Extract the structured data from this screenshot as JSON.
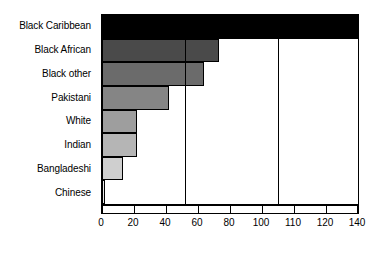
{
  "chart_data": {
    "type": "bar",
    "orientation": "horizontal",
    "title": "",
    "subtitle": "",
    "xlabel": "",
    "ylabel": "",
    "grid": false,
    "legend": null,
    "legend_position": "none",
    "axis_note": "x tick labels are equally spaced on screen although their numeric gaps differ (0,20,40,60,80,100,110,120,140)",
    "xticks": [
      0,
      20,
      40,
      60,
      80,
      100,
      110,
      120,
      140
    ],
    "xtick_labels": [
      "0",
      "20",
      "40",
      "60",
      "80",
      "100",
      "110",
      "120",
      "140"
    ],
    "xlim": [
      0,
      140
    ],
    "categories": [
      "Black Caribbean",
      "Black African",
      "Black other",
      "Pakistani",
      "White",
      "Indian",
      "Bangladeshi",
      "Chinese"
    ],
    "values": [
      140,
      73,
      64,
      42,
      22,
      22,
      13,
      1
    ],
    "bar_colors": [
      "#000000",
      "#4a4a4a",
      "#6b6b6b",
      "#858585",
      "#9e9e9e",
      "#b5b5b5",
      "#cfcfcf",
      "#e8e8e8"
    ],
    "bar_edge_color": "#000000",
    "annotations": [
      {
        "type": "vertical-reference-line",
        "value": 52,
        "color": "#000000"
      },
      {
        "type": "vertical-reference-line",
        "value": 105,
        "color": "#000000"
      }
    ]
  }
}
